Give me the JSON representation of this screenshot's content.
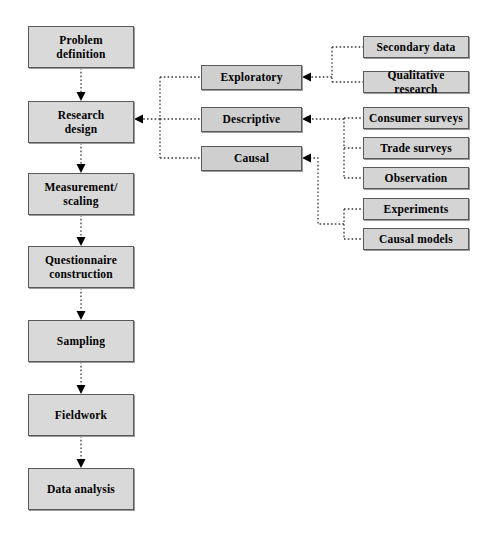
{
  "diagram": {
    "colors": {
      "box_fill": "#d9d9d9",
      "type_fill": "#cfcfcf",
      "border": "#5a5a5a",
      "connector": "#3a3a3a",
      "background": "#ffffff"
    },
    "process_steps": [
      {
        "label": "Problem definition",
        "lines": [
          "Problem",
          "definition"
        ],
        "x": 28,
        "y": 26,
        "w": 106,
        "h": 42
      },
      {
        "label": "Research design",
        "lines": [
          "Research",
          "design"
        ],
        "x": 28,
        "y": 101,
        "w": 106,
        "h": 42
      },
      {
        "label": "Measurement/ scaling",
        "lines": [
          "Measurement/",
          "scaling"
        ],
        "x": 28,
        "y": 173,
        "w": 106,
        "h": 42
      },
      {
        "label": "Questionnaire construction",
        "lines": [
          "Questionnaire",
          "construction"
        ],
        "x": 28,
        "y": 246,
        "w": 106,
        "h": 42
      },
      {
        "label": "Sampling",
        "lines": [
          "Sampling"
        ],
        "x": 28,
        "y": 320,
        "w": 106,
        "h": 42
      },
      {
        "label": "Fieldwork",
        "lines": [
          "Fieldwork"
        ],
        "x": 28,
        "y": 394,
        "w": 106,
        "h": 42
      },
      {
        "label": "Data analysis",
        "lines": [
          "Data analysis"
        ],
        "x": 28,
        "y": 468,
        "w": 106,
        "h": 42
      }
    ],
    "design_types": [
      {
        "label": "Exploratory",
        "x": 201,
        "y": 65,
        "w": 101,
        "h": 25
      },
      {
        "label": "Descriptive",
        "x": 201,
        "y": 107,
        "w": 101,
        "h": 25
      },
      {
        "label": "Causal",
        "x": 201,
        "y": 146,
        "w": 101,
        "h": 25
      }
    ],
    "methods": [
      {
        "label": "Secondary data",
        "x": 363,
        "y": 36,
        "w": 106,
        "h": 22,
        "parent": "Exploratory"
      },
      {
        "label": "Qualitative research",
        "x": 363,
        "y": 71,
        "w": 106,
        "h": 22,
        "parent": "Exploratory"
      },
      {
        "label": "Consumer surveys",
        "x": 363,
        "y": 107,
        "w": 106,
        "h": 22,
        "parent": "Descriptive"
      },
      {
        "label": "Trade surveys",
        "x": 363,
        "y": 137,
        "w": 106,
        "h": 22,
        "parent": "Descriptive"
      },
      {
        "label": "Observation",
        "x": 363,
        "y": 167,
        "w": 106,
        "h": 22,
        "parent": "Descriptive"
      },
      {
        "label": "Experiments",
        "x": 363,
        "y": 198,
        "w": 106,
        "h": 22,
        "parent": "Causal"
      },
      {
        "label": "Causal models",
        "x": 363,
        "y": 228,
        "w": 106,
        "h": 22,
        "parent": "Causal"
      }
    ],
    "flow_direction": "top-to-bottom, dotted arrows",
    "connector_style": "dotted"
  }
}
